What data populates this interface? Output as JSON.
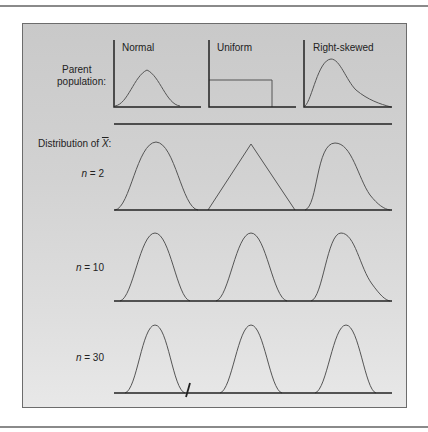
{
  "figure": {
    "parent_label_line1": "Parent",
    "parent_label_line2": "population:",
    "distribution_label_prefix": "Distribution of ",
    "distribution_label_symbol": "X",
    "distribution_label_suffix": ":",
    "columns": [
      {
        "name": "Normal"
      },
      {
        "name": "Uniform"
      },
      {
        "name": "Right-skewed"
      }
    ],
    "rows": [
      {
        "n_var": "n",
        "n_eq": " = 2"
      },
      {
        "n_var": "n",
        "n_eq": " = 10"
      },
      {
        "n_var": "n",
        "n_eq": " = 30"
      }
    ]
  },
  "colors": {
    "panel_bg": "#d2d2d2",
    "curve": "#555555",
    "axis": "#222222"
  }
}
